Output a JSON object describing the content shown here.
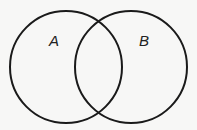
{
  "diagram": {
    "type": "venn",
    "sets": [
      {
        "label": "A",
        "cx": 66,
        "cy": 67,
        "r": 56
      },
      {
        "label": "B",
        "cx": 131,
        "cy": 67,
        "r": 56
      }
    ],
    "stroke_color": "#1a1a1a",
    "background": "#f7f7f6"
  }
}
